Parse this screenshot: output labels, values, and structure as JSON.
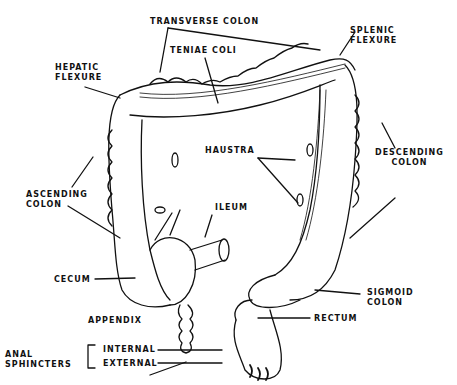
{
  "diagram": {
    "labels": {
      "transverse_colon": "TRANSVERSE COLON",
      "splenic_flexure_1": "SPLENIC",
      "splenic_flexure_2": "FLEXURE",
      "teniae_coli": "TENIAE COLI",
      "hepatic_flexure_1": "HEPATIC",
      "hepatic_flexure_2": "FLEXURE",
      "haustra": "HAUSTRA",
      "descending_colon_1": "DESCENDING",
      "descending_colon_2": "COLON",
      "ascending_colon_1": "ASCENDING",
      "ascending_colon_2": "COLON",
      "ileum": "ILEUM",
      "cecum": "CECUM",
      "sigmoid_colon_1": "SIGMOID",
      "sigmoid_colon_2": "COLON",
      "appendix": "APPENDIX",
      "rectum": "RECTUM",
      "anal_sphincters_1": "ANAL",
      "anal_sphincters_2": "SPHINCTERS",
      "internal": "INTERNAL",
      "external": "EXTERNAL"
    },
    "colors": {
      "ink": "#111111",
      "background": "#ffffff"
    }
  }
}
